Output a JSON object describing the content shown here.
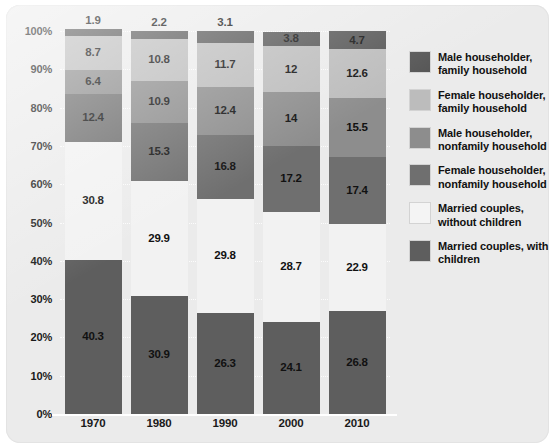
{
  "chart_data": {
    "type": "bar",
    "stacked": true,
    "normalized": "percent",
    "title": "",
    "subtitle": "",
    "xlabel": "",
    "ylabel": "",
    "categories": [
      "1970",
      "1980",
      "1990",
      "2000",
      "2010"
    ],
    "ylim": [
      0,
      100
    ],
    "ytick_labels": [
      "0%",
      "10%",
      "20%",
      "30%",
      "40%",
      "50%",
      "60%",
      "70%",
      "80%",
      "90%",
      "100%"
    ],
    "ytick_values": [
      0,
      10,
      20,
      30,
      40,
      50,
      60,
      70,
      80,
      90,
      100
    ],
    "grid": "horizontal-dotted",
    "legend_position": "right",
    "series": [
      {
        "name": "Married couples, with children",
        "color": "#5e5e5e",
        "values": [
          40.3,
          30.9,
          26.3,
          24.1,
          26.8
        ],
        "labels": [
          "40.3",
          "30.9",
          "26.3",
          "24.1",
          "26.8"
        ]
      },
      {
        "name": "Married couples, without children",
        "color": "#f2f2f2",
        "values": [
          30.8,
          29.9,
          29.8,
          28.7,
          22.9
        ],
        "labels": [
          "30.8",
          "29.9",
          "29.8",
          "28.7",
          "22.9"
        ]
      },
      {
        "name": "Female householder, nonfamily household",
        "color": "#6f6f6f",
        "values": [
          12.4,
          15.3,
          16.8,
          17.2,
          17.4
        ],
        "labels": [
          "12.4",
          "15.3",
          "16.8",
          "17.2",
          "17.4"
        ]
      },
      {
        "name": "Male householder, nonfamily household",
        "color": "#8d8d8d",
        "values": [
          6.4,
          10.9,
          12.4,
          14.0,
          15.5
        ],
        "labels": [
          "6.4",
          "10.9",
          "12.4",
          "14",
          "15.5"
        ]
      },
      {
        "name": "Female householder, family household",
        "color": "#bcbcbc",
        "values": [
          8.7,
          10.8,
          11.7,
          12.0,
          12.6
        ],
        "labels": [
          "8.7",
          "10.8",
          "11.7",
          "12",
          "12.6"
        ]
      },
      {
        "name": "Male householder, family household",
        "color": "#565656",
        "values": [
          1.9,
          2.2,
          3.1,
          3.8,
          4.7
        ],
        "labels": [
          "1.9",
          "2.2",
          "3.1",
          "3.8",
          "4.7"
        ]
      }
    ]
  },
  "legend": {
    "items": [
      {
        "label": "Male householder, family household",
        "color": "#565656"
      },
      {
        "label": "Female householder, family household",
        "color": "#bcbcbc"
      },
      {
        "label": "Male householder, nonfamily household",
        "color": "#8d8d8d"
      },
      {
        "label": "Female householder, nonfamily household",
        "color": "#6f6f6f"
      },
      {
        "label": "Married couples, without children",
        "color": "#f4f4f4"
      },
      {
        "label": "Married couples, with children",
        "color": "#5e5e5e"
      }
    ]
  },
  "panel": {
    "background_color": "#ebebeb",
    "gridline_color": "#ffffff",
    "text_color": "#111111"
  }
}
